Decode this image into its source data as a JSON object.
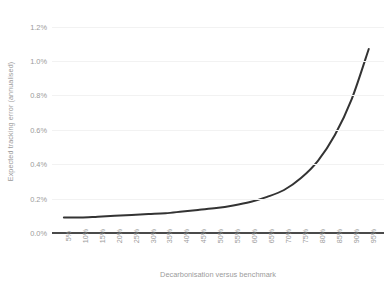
{
  "chart_data": {
    "type": "line",
    "title": "",
    "xlabel": "Decarbonisation versus benchmark",
    "ylabel": "Expected tracking error (annualised)",
    "x": [
      "5%",
      "10%",
      "15%",
      "20%",
      "25%",
      "30%",
      "35%",
      "40%",
      "45%",
      "50%",
      "55%",
      "60%",
      "65%",
      "70%",
      "75%",
      "80%",
      "85%",
      "90%",
      "95%"
    ],
    "values": [
      0.09,
      0.09,
      0.095,
      0.1,
      0.105,
      0.11,
      0.115,
      0.125,
      0.135,
      0.145,
      0.16,
      0.18,
      0.21,
      0.25,
      0.32,
      0.42,
      0.57,
      0.78,
      1.07
    ],
    "xtick_labels": [
      "5%",
      "10%",
      "15%",
      "20%",
      "25%",
      "30%",
      "35%",
      "40%",
      "45%",
      "50%",
      "55%",
      "60%",
      "65%",
      "70%",
      "75%",
      "80%",
      "85%",
      "90%",
      "95%"
    ],
    "ytick_labels": [
      "0.0%",
      "0.2%",
      "0.4%",
      "0.6%",
      "0.8%",
      "1.0%",
      "1.2%"
    ],
    "ytick_values": [
      0.0,
      0.2,
      0.4,
      0.6,
      0.8,
      1.0,
      1.2
    ],
    "ylim": [
      0.0,
      1.25
    ],
    "grid": true,
    "legend": "none",
    "series_color": "#333333",
    "grid_color": "#f2f2f2",
    "axis_color": "#4a4a4a",
    "tick_label_color": "#9b9b9b"
  }
}
